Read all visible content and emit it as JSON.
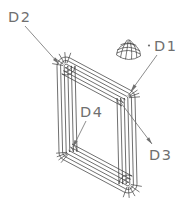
{
  "diagram": {
    "type": "cad-wireframe-frame-with-dome",
    "background_color": "#ffffff",
    "frame_line_color": "#3f3f3f",
    "dome_line_color": "#333333",
    "dome_shade_color": "#2e2e2e",
    "annotation_color": "#6f6f6f",
    "labels": [
      {
        "id": "D2",
        "text": "D2"
      },
      {
        "id": "D1",
        "text": "D1"
      },
      {
        "id": "D4",
        "text": "D4"
      },
      {
        "id": "D3",
        "text": "D3"
      }
    ]
  }
}
